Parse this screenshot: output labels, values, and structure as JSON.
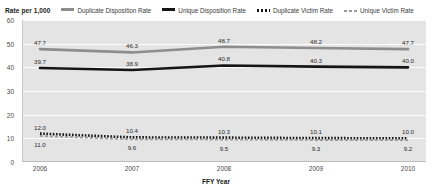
{
  "legend": {
    "title": "Rate per 1,000",
    "entries": [
      {
        "label": "Duplicate Disposition Rate",
        "style": "solid-gray",
        "color": "#8d8d8d"
      },
      {
        "label": "Unique Disposition Rate",
        "style": "solid-black",
        "color": "#151515"
      },
      {
        "label": "Duplicate Victim Rate",
        "style": "dotted-black",
        "color": "#151515"
      },
      {
        "label": "Unique Victim Rate",
        "style": "dashed-gray",
        "color": "#9a9a9a"
      }
    ]
  },
  "axes": {
    "y_ticks": [
      "0",
      "10",
      "20",
      "30",
      "40",
      "50",
      "60"
    ],
    "x_ticks": [
      "2006",
      "2007",
      "2008",
      "2009",
      "2010"
    ],
    "x_title": "FFY Year"
  },
  "chart_data": {
    "type": "line",
    "title": "",
    "xlabel": "FFY Year",
    "ylabel": "Rate per 1,000",
    "categories": [
      "2006",
      "2007",
      "2008",
      "2009",
      "2010"
    ],
    "ylim": [
      0,
      60
    ],
    "yticks": [
      0,
      10,
      20,
      30,
      40,
      50,
      60
    ],
    "grid": true,
    "legend_position": "top",
    "series": [
      {
        "name": "Duplicate Disposition Rate",
        "color": "#8d8d8d",
        "linestyle": "solid",
        "values": [
          47.7,
          46.3,
          48.7,
          48.2,
          47.7
        ],
        "labels": [
          "47.7",
          "46.3",
          "48.7",
          "48.2",
          "47.7"
        ]
      },
      {
        "name": "Unique Disposition Rate",
        "color": "#151515",
        "linestyle": "solid",
        "values": [
          39.7,
          38.9,
          40.8,
          40.3,
          40.0
        ],
        "labels": [
          "39.7",
          "38.9",
          "40.8",
          "40.3",
          "40.0"
        ]
      },
      {
        "name": "Duplicate Victim Rate",
        "color": "#151515",
        "linestyle": "dotted",
        "values": [
          12.0,
          10.4,
          10.3,
          10.1,
          10.0
        ],
        "labels": [
          "12.0",
          "10.4",
          "10.3",
          "10.1",
          "10.0"
        ]
      },
      {
        "name": "Unique Victim Rate",
        "color": "#9a9a9a",
        "linestyle": "dashed",
        "values": [
          11.0,
          9.6,
          9.5,
          9.3,
          9.2
        ],
        "labels": [
          "11.0",
          "9.6",
          "9.5",
          "9.3",
          "9.2"
        ]
      }
    ]
  }
}
